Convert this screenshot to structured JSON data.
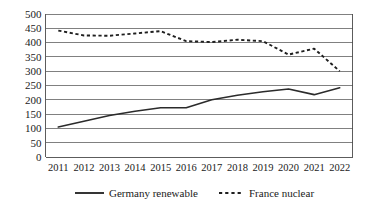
{
  "chart_data": {
    "type": "line",
    "title": "",
    "subtitle": "",
    "xlabel": "",
    "ylabel": "",
    "categories": [
      "2011",
      "2012",
      "2013",
      "2014",
      "2015",
      "2016",
      "2017",
      "2018",
      "2019",
      "2020",
      "2021",
      "2022"
    ],
    "series": [
      {
        "name": "Germany renewable",
        "style": "solid",
        "color": "#2b2b2b",
        "values": [
          105,
          125,
          145,
          160,
          172,
          172,
          200,
          216,
          228,
          238,
          218,
          242
        ]
      },
      {
        "name": "France nuclear",
        "style": "dashed",
        "color": "#1f1f1f",
        "values": [
          442,
          425,
          424,
          432,
          440,
          405,
          402,
          410,
          405,
          358,
          379,
          300
        ]
      }
    ],
    "ylim": [
      0,
      500
    ],
    "ytick_step": 50,
    "yticks": [
      "0",
      "50",
      "100",
      "150",
      "200",
      "250",
      "300",
      "350",
      "400",
      "450",
      "500"
    ],
    "grid": true,
    "grid_axis": "y",
    "legend_position": "bottom",
    "legend": [
      {
        "label": "Germany renewable",
        "style": "solid"
      },
      {
        "label": "France nuclear",
        "style": "dashed"
      }
    ]
  }
}
